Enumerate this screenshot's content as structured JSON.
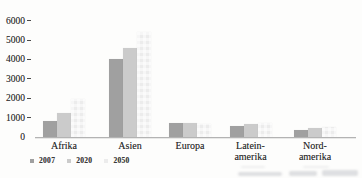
{
  "chart_data": {
    "type": "bar",
    "title": "",
    "xlabel": "",
    "ylabel": "",
    "categories": [
      "Afrika",
      "Asien",
      "Europa",
      "Latein-amerika",
      "Nord-amerika"
    ],
    "category_label_lines": [
      [
        "Afrika"
      ],
      [
        "Asien"
      ],
      [
        "Europa"
      ],
      [
        "Latein-",
        "amerika"
      ],
      [
        "Nord-",
        "amerika"
      ]
    ],
    "series": [
      {
        "name": "2007",
        "color": "#a0a0a0",
        "values": [
          800,
          4000,
          730,
          590,
          360
        ]
      },
      {
        "name": "2020",
        "color": "#cbcbcb",
        "values": [
          1250,
          4600,
          715,
          665,
          460
        ]
      },
      {
        "name": "2050",
        "color": "#ececec",
        "values": [
          1950,
          5400,
          650,
          730,
          500
        ]
      }
    ],
    "y_axis": {
      "ticks": [
        0,
        1000,
        2000,
        3000,
        4000,
        5000,
        6000
      ],
      "range": [
        0,
        6000
      ],
      "grid": false
    },
    "legend": {
      "position": "bottom-left",
      "entries": [
        "2007",
        "2020",
        "2050"
      ]
    }
  },
  "colors": {
    "background": "#fdfdfc",
    "axis": "#b3b3b3",
    "text": "#2e2e2e",
    "series_2007": "#a0a0a0",
    "series_2020": "#cbcbcb",
    "series_2050": "#ececec"
  },
  "artifacts": {
    "bottom_caption": "illegible caption line cut off at bottom edge of scan"
  }
}
